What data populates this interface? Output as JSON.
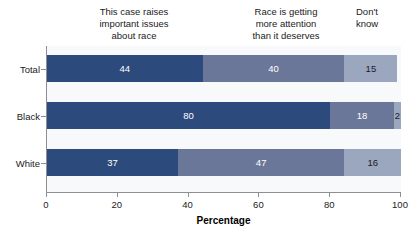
{
  "figure": {
    "clipped_caption_fragment": "· · · ·· · ·",
    "background_color": "#ffffff",
    "plot_background_color": "#f7f9fa",
    "axis_color": "#8c8f94"
  },
  "column_headers": [
    {
      "id": "raises-issues",
      "text": "This case raises\nimportant issues\nabout race"
    },
    {
      "id": "too-much-attention",
      "text": "Race is getting\nmore attention\nthan it deserves"
    },
    {
      "id": "dont-know",
      "text": "Don't\nknow"
    }
  ],
  "chart_data": {
    "type": "bar",
    "orientation": "horizontal",
    "stacked": true,
    "title": "",
    "xlabel": "Percentage",
    "ylabel": "",
    "xlim": [
      0,
      100
    ],
    "xticks": [
      0,
      20,
      40,
      60,
      80,
      100
    ],
    "grid": false,
    "legend_position": "top",
    "categories": [
      "Total",
      "Black",
      "White"
    ],
    "series": [
      {
        "name": "This case raises important issues about race",
        "color": "#2c4a7c",
        "values": [
          44,
          80,
          37
        ]
      },
      {
        "name": "Race is getting more attention than it deserves",
        "color": "#6b7799",
        "values": [
          40,
          18,
          47
        ]
      },
      {
        "name": "Don't know",
        "color": "#9ba6bf",
        "values": [
          15,
          2,
          16
        ]
      }
    ],
    "labels": {
      "Total": [
        "44",
        "40",
        "15"
      ],
      "Black": [
        "80",
        "18",
        "2"
      ],
      "White": [
        "37",
        "47",
        "16"
      ]
    }
  },
  "axis": {
    "x_tick_labels": [
      "0",
      "20",
      "40",
      "60",
      "80",
      "100"
    ],
    "x_title": "Percentage",
    "y_tick_labels": [
      "Total",
      "Black",
      "White"
    ]
  }
}
